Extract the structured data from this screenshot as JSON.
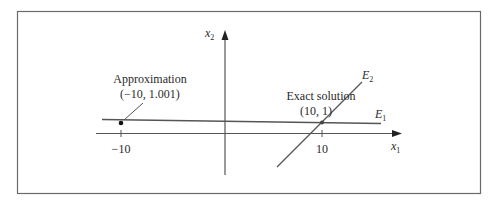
{
  "figure": {
    "axes": {
      "x_label": "x",
      "x_label_sub": "1",
      "y_label": "x",
      "y_label_sub": "2",
      "ticks": [
        {
          "value": -10,
          "label": "−10"
        },
        {
          "value": 10,
          "label": "10"
        }
      ]
    },
    "lines": {
      "e1": {
        "label": "E",
        "sub": "1"
      },
      "e2": {
        "label": "E",
        "sub": "2"
      }
    },
    "annotations": {
      "approximation": {
        "title": "Approximation",
        "coords": "(−10, 1.001)"
      },
      "exact": {
        "title": "Exact solution",
        "coords": "(10, 1)"
      }
    }
  },
  "colors": {
    "line": "#555555",
    "frame": "#6a6a6a",
    "text": "#2a2a2a"
  }
}
